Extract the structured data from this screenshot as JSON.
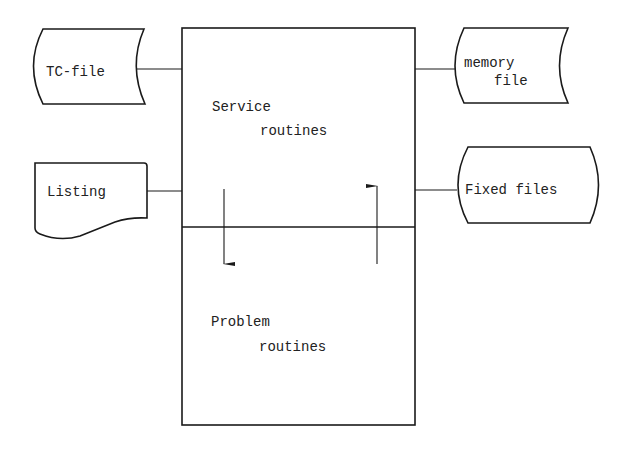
{
  "diagram": {
    "main_box": {
      "top_section": {
        "line1": "Service",
        "line2": "routines"
      },
      "bottom_section": {
        "line1": "Problem",
        "line2": "routines"
      }
    },
    "left_nodes": [
      {
        "id": "tc-file",
        "shape": "stored-data",
        "label": "TC-file"
      },
      {
        "id": "listing",
        "shape": "document",
        "label": "Listing"
      }
    ],
    "right_nodes": [
      {
        "id": "memory-file",
        "shape": "stored-data",
        "line1": "memory",
        "line2": "file"
      },
      {
        "id": "fixed-files",
        "shape": "terminal-rounded",
        "label": "Fixed files"
      }
    ],
    "arrows": [
      {
        "from": "Service routines",
        "to": "Problem routines",
        "direction": "down"
      },
      {
        "from": "Problem routines",
        "to": "Service routines",
        "direction": "up"
      }
    ],
    "colors": {
      "line": "#1a1a1a",
      "background": "#ffffff",
      "text": "#222222"
    }
  }
}
